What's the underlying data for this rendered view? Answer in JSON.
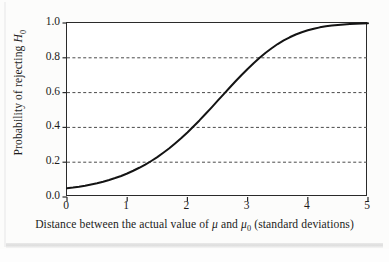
{
  "figure": {
    "background_color": "#fdfdfd",
    "frame_color": "#2a2a2a",
    "curve_color": "#141414",
    "grid_color": "#4a4a4a"
  },
  "chart_data": {
    "type": "line",
    "title": "",
    "subtitle": "",
    "xlabel": "Distance between the actual value of μ and μ₀ (standard deviations)",
    "ylabel": "Probability of rejecting H₀",
    "xlabel_parts": {
      "pre": "Distance between the actual value of ",
      "mu": "μ",
      "mid": " and ",
      "mu0_base": "μ",
      "mu0_sub": "0",
      "post": " (standard deviations)"
    },
    "ylabel_parts": {
      "pre": "Probability of rejecting ",
      "h_base": "H",
      "h_sub": "0"
    },
    "xlim": [
      0,
      5
    ],
    "ylim": [
      0,
      1
    ],
    "xticks": [
      0,
      1,
      2,
      3,
      4,
      5
    ],
    "xticklabels": [
      "0",
      "1",
      "2",
      "3",
      "4",
      "5"
    ],
    "yticks": [
      0.0,
      0.2,
      0.4,
      0.6,
      0.8,
      1.0
    ],
    "yticklabels": [
      "0.0",
      "0.2",
      "0.4",
      "0.6",
      "0.8",
      "1.0"
    ],
    "grid": true,
    "grid_axis": "y",
    "grid_style": "dashed",
    "grid_values": [
      0.2,
      0.4,
      0.6,
      0.8
    ],
    "legend": null,
    "legend_position": "none",
    "annotations": [],
    "series": [
      {
        "name": "Power curve",
        "x": [
          0.0,
          0.1,
          0.2,
          0.3,
          0.4,
          0.5,
          0.6,
          0.7,
          0.8,
          0.9,
          1.0,
          1.1,
          1.2,
          1.3,
          1.4,
          1.5,
          1.6,
          1.7,
          1.8,
          1.9,
          2.0,
          2.1,
          2.2,
          2.3,
          2.4,
          2.5,
          2.6,
          2.7,
          2.8,
          2.9,
          3.0,
          3.1,
          3.2,
          3.3,
          3.4,
          3.5,
          3.6,
          3.7,
          3.8,
          3.9,
          4.0,
          4.1,
          4.2,
          4.3,
          4.4,
          4.5,
          4.6,
          4.7,
          4.8,
          4.9,
          5.0
        ],
        "y": [
          0.05,
          0.054,
          0.059,
          0.065,
          0.072,
          0.079,
          0.088,
          0.098,
          0.109,
          0.121,
          0.135,
          0.151,
          0.168,
          0.186,
          0.207,
          0.229,
          0.254,
          0.28,
          0.309,
          0.339,
          0.371,
          0.405,
          0.44,
          0.477,
          0.514,
          0.552,
          0.59,
          0.628,
          0.665,
          0.701,
          0.736,
          0.769,
          0.8,
          0.829,
          0.855,
          0.879,
          0.9,
          0.918,
          0.934,
          0.947,
          0.958,
          0.967,
          0.975,
          0.981,
          0.985,
          0.989,
          0.992,
          0.994,
          0.996,
          0.997,
          0.998
        ]
      }
    ]
  }
}
